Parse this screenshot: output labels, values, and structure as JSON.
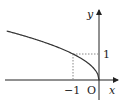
{
  "diagram": {
    "title": "",
    "function": "y = sqrt(-x)",
    "x_domain": [
      -3.55,
      0
    ],
    "axes": {
      "x_label": "x",
      "y_label": "y",
      "origin_label": "O"
    },
    "marked_point": {
      "x": -1,
      "y": 1
    },
    "tick_labels": {
      "x_tick": "−1",
      "y_tick": "1"
    },
    "colors": {
      "axis": "#222222",
      "curve": "#333333",
      "guide": "#888888"
    }
  }
}
